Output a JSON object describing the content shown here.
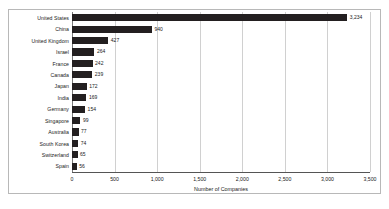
{
  "chart_data": {
    "type": "bar",
    "orientation": "horizontal",
    "title": "",
    "xlabel": "Number of Companies",
    "ylabel": "",
    "xlim": [
      0,
      3500
    ],
    "grid": true,
    "legend": false,
    "xticks": [
      "0",
      "500",
      "1,000",
      "1,500",
      "2,000",
      "2,500",
      "3,000",
      "3,500"
    ],
    "xtick_values": [
      0,
      500,
      1000,
      1500,
      2000,
      2500,
      3000,
      3500
    ],
    "categories": [
      "United States",
      "China",
      "United Kingdom",
      "Israel",
      "France",
      "Canada",
      "Japan",
      "India",
      "Germany",
      "Singapore",
      "Australia",
      "South Korea",
      "Switzerland",
      "Spain"
    ],
    "values": [
      3234,
      940,
      427,
      264,
      242,
      239,
      172,
      169,
      154,
      99,
      77,
      74,
      65,
      56
    ],
    "value_labels": [
      "3,234",
      "940",
      "427",
      "264",
      "242",
      "239",
      "172",
      "169",
      "154",
      "99",
      "77",
      "74",
      "65",
      "56"
    ],
    "bar_color": "#231f20",
    "grid_color": "#d0d0d0",
    "axis_color": "#555555",
    "background_color": "#ffffff"
  }
}
